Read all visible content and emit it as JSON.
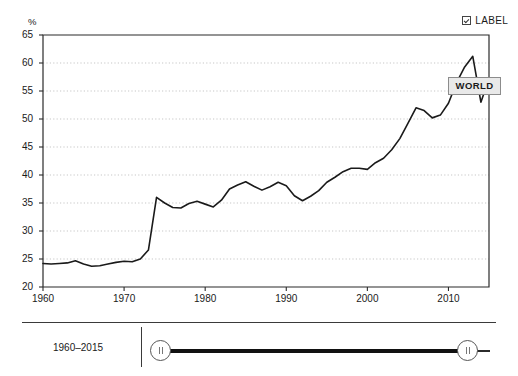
{
  "header": {
    "label_toggle": "LABEL",
    "label_toggle_checked": true,
    "checkbox_icon": "checkbox-checked-icon"
  },
  "chart_data": {
    "type": "line",
    "title": "",
    "subtitle": "",
    "xlabel": "",
    "ylabel": "%",
    "unit": "%",
    "xlim": [
      1960,
      2015
    ],
    "ylim": [
      20,
      65
    ],
    "ytick_step": 5,
    "grid": true,
    "grid_style": "dotted-horizontal",
    "legend_position": "inline-annotation",
    "annotations": [
      {
        "text": "WORLD",
        "x": 2011,
        "y": 56
      }
    ],
    "ytick_labels": [
      "20",
      "25",
      "30",
      "35",
      "40",
      "45",
      "50",
      "55",
      "60",
      "65"
    ],
    "ytick_values": [
      20,
      25,
      30,
      35,
      40,
      45,
      50,
      55,
      60,
      65
    ],
    "xtick_labels": [
      "1960",
      "1970",
      "1980",
      "1990",
      "2000",
      "2010"
    ],
    "xtick_values": [
      1960,
      1970,
      1980,
      1990,
      2000,
      2010
    ],
    "series": [
      {
        "name": "WORLD",
        "color": "#1a1a1a",
        "x": [
          1960,
          1961,
          1962,
          1963,
          1964,
          1965,
          1966,
          1967,
          1968,
          1969,
          1970,
          1971,
          1972,
          1973,
          1974,
          1975,
          1976,
          1977,
          1978,
          1979,
          1980,
          1981,
          1982,
          1983,
          1984,
          1985,
          1986,
          1987,
          1988,
          1989,
          1990,
          1991,
          1992,
          1993,
          1994,
          1995,
          1996,
          1997,
          1998,
          1999,
          2000,
          2001,
          2002,
          2003,
          2004,
          2005,
          2006,
          2007,
          2008,
          2009,
          2010,
          2011,
          2012,
          2013,
          2014,
          2015
        ],
        "values": [
          24.2,
          24.1,
          24.2,
          24.3,
          24.7,
          24.1,
          23.7,
          23.8,
          24.1,
          24.4,
          24.6,
          24.5,
          25.0,
          26.6,
          31.4,
          35.9,
          34.3,
          34.1,
          34.9,
          35.0,
          34.6,
          34.3,
          35.3,
          37.3,
          38.2,
          38.6,
          38.0,
          37.4,
          37.8,
          38.6,
          38.0,
          36.3,
          35.5,
          36.1,
          37.1,
          38.7,
          39.6,
          40.6,
          41.4,
          41.3,
          41.2,
          42.2,
          43.0,
          44.6,
          46.7,
          49.3,
          51.9,
          51.6,
          50.2,
          50.6,
          52.9,
          56.6,
          59.2,
          61.2,
          53.0,
          57.0
        ]
      }
    ],
    "series_path_values": [
      24.2,
      24.1,
      24.2,
      24.3,
      24.7,
      24.1,
      23.7,
      23.8,
      24.1,
      24.4,
      24.6,
      24.5,
      25.0,
      26.6,
      36.0,
      35.0,
      34.2,
      34.1,
      34.9,
      35.3,
      34.8,
      34.3,
      35.5,
      37.5,
      38.2,
      38.8,
      38.0,
      37.3,
      37.9,
      38.7,
      38.1,
      36.3,
      35.4,
      36.2,
      37.2,
      38.7,
      39.6,
      40.6,
      41.2,
      41.2,
      41.0,
      42.2,
      43.0,
      44.5,
      46.5,
      49.2,
      52.0,
      51.5,
      50.2,
      50.7,
      52.8,
      56.5,
      59.3,
      61.2,
      53.0,
      57.2
    ]
  },
  "range_slider": {
    "caption": "1960–2015",
    "start_year": 1960,
    "end_year": 2015,
    "start_handle_name": "range-start-handle",
    "end_handle_name": "range-end-handle"
  },
  "colors": {
    "line": "#1a1a1a",
    "axis": "#2b2b2b",
    "grid": "#b9b9b9",
    "label_box_bg": "#e9e9e9",
    "label_box_border": "#8c8c8c",
    "background": "#ffffff"
  }
}
